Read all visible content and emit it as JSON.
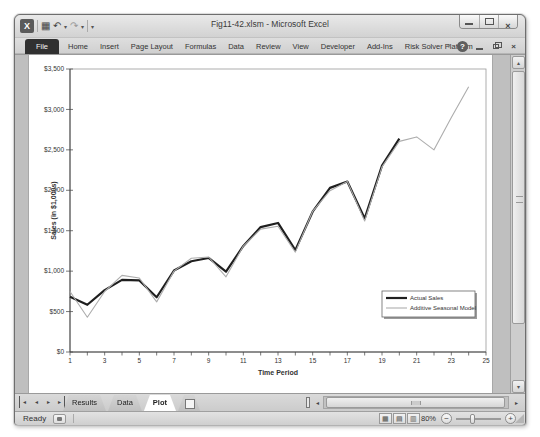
{
  "titlebar": {
    "title": "Fig11-42.xlsm - Microsoft Excel"
  },
  "icons": {
    "excel_logo": "X",
    "save": "▦",
    "undo": "↶",
    "redo": "↷",
    "dropdown_arrow": "▾",
    "ribbon_collapse": "▿",
    "help": "?",
    "close": "×",
    "nav_first": "◂",
    "nav_prev": "◂",
    "nav_next": "▸",
    "nav_last": "▸",
    "scroll_up": "▴",
    "scroll_down": "▾",
    "scroll_left": "◂",
    "scroll_right": "▸",
    "view_normal": "▦",
    "view_page_layout": "▤",
    "view_page_break": "▥",
    "zoom_out": "−",
    "zoom_in": "+"
  },
  "ribbon": {
    "file_tab": "File",
    "tabs": [
      "Home",
      "Insert",
      "Page Layout",
      "Formulas",
      "Data",
      "Review",
      "View",
      "Developer",
      "Add-Ins",
      "Risk Solver Platform"
    ]
  },
  "sheet_tabs": [
    {
      "label": "Results",
      "active": false
    },
    {
      "label": "Data",
      "active": false
    },
    {
      "label": "Plot",
      "active": true
    }
  ],
  "status_bar": {
    "mode": "Ready",
    "zoom_level": "80%"
  },
  "chart_data": {
    "type": "line",
    "title": "",
    "xlabel": "Time Period",
    "ylabel": "Sales (in $1,000s)",
    "xlim": [
      1,
      25
    ],
    "ylim": [
      0,
      3500
    ],
    "grid": false,
    "x_tick_step": 1,
    "x_label_values": [
      1,
      3,
      5,
      7,
      9,
      11,
      13,
      15,
      17,
      19,
      21,
      23,
      25
    ],
    "y_ticks": [
      0,
      500,
      1000,
      1500,
      2000,
      2500,
      3000,
      3500
    ],
    "y_tick_labels": [
      "$0",
      "$500",
      "$1,000",
      "$1,500",
      "$2,000",
      "$2,500",
      "$3,000",
      "$3,500"
    ],
    "legend_position": "lower right",
    "series": [
      {
        "name": "Actual Sales",
        "color": "#1f1f1f",
        "line_width": 2.2,
        "x": [
          1,
          2,
          3,
          4,
          5,
          6,
          7,
          8,
          9,
          10,
          11,
          12,
          13,
          14,
          15,
          16,
          17,
          18,
          19,
          20
        ],
        "values": [
          684,
          584,
          765,
          892,
          885,
          677,
          1007,
          1122,
          1163,
          993,
          1312,
          1545,
          1596,
          1260,
          1735,
          2030,
          2108,
          1650,
          2304,
          2639
        ]
      },
      {
        "name": "Additive Seasonal Model",
        "color": "#adadad",
        "line_width": 1.1,
        "x": [
          1,
          2,
          3,
          4,
          5,
          6,
          7,
          8,
          9,
          10,
          11,
          12,
          13,
          14,
          15,
          16,
          17,
          18,
          19,
          20,
          21,
          22,
          23,
          24
        ],
        "values": [
          748,
          430,
          748,
          948,
          915,
          620,
          1000,
          1160,
          1175,
          930,
          1310,
          1520,
          1555,
          1235,
          1740,
          1995,
          2110,
          1620,
          2290,
          2605,
          2660,
          2500,
          2900,
          3280
        ]
      }
    ]
  }
}
